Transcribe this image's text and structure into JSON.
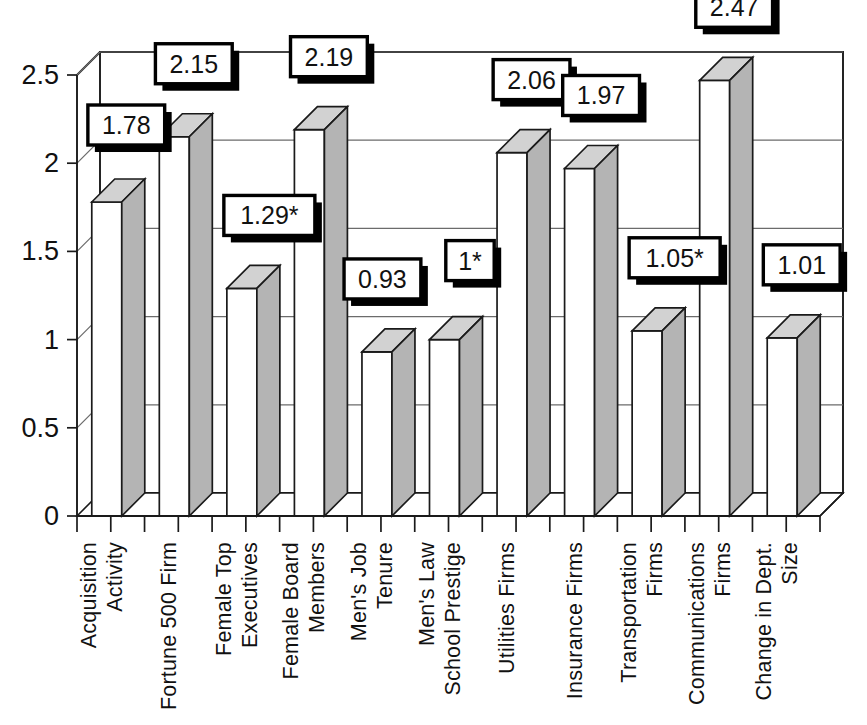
{
  "chart_data": {
    "type": "bar",
    "title": "",
    "subtitle": "",
    "xlabel": "",
    "ylabel": "",
    "ylim": [
      0,
      2.5
    ],
    "ytick_labels": [
      "0",
      "0.5",
      "1",
      "1.5",
      "2",
      "2.5"
    ],
    "ytick_values": [
      0,
      0.5,
      1,
      1.5,
      2,
      2.5
    ],
    "grid": true,
    "legend": "none",
    "style": "3d-column",
    "categories": [
      "Acquisition Activity",
      "Fortune 500 Firm",
      "Female Top Executives",
      "Female Board Members",
      "Men's Job Tenure",
      "Men's Law School Prestige",
      "Utilities Firms",
      "Insurance Firms",
      "Transportation Firms",
      "Communications Firms",
      "Change in Dept. Size"
    ],
    "category_lines": [
      [
        "Acquisition",
        "Activity"
      ],
      [
        "Fortune 500 Firm"
      ],
      [
        "Female Top",
        "Executives"
      ],
      [
        "Female Board",
        "Members"
      ],
      [
        "Men's Job",
        "Tenure"
      ],
      [
        "Men's Law",
        "School Prestige"
      ],
      [
        "Utilities Firms"
      ],
      [
        "Insurance Firms"
      ],
      [
        "Transportation",
        "Firms"
      ],
      [
        "Communications",
        "Firms"
      ],
      [
        "Change in Dept.",
        "Size"
      ]
    ],
    "values": [
      1.78,
      2.15,
      1.29,
      2.19,
      0.93,
      1,
      2.06,
      1.97,
      1.05,
      2.47,
      1.01
    ],
    "data_labels": [
      "1.78",
      "2.15",
      "1.29*",
      "2.19",
      "0.93",
      "1*",
      "2.06",
      "1.97",
      "1.05*",
      "2.47",
      "1.01"
    ],
    "significance_marked": [
      false,
      false,
      true,
      false,
      false,
      true,
      false,
      false,
      true,
      false,
      false
    ],
    "colors": {
      "bar_front": "#ffffff",
      "bar_top": "#d2d2d2",
      "bar_side": "#b4b4b4",
      "outline": "#1a1a1a",
      "gridline": "#6b6b6b",
      "text": "#111111",
      "callout_fill": "#ffffff",
      "callout_border": "#000000",
      "callout_shadow": "#000000",
      "background": "#ffffff"
    }
  }
}
